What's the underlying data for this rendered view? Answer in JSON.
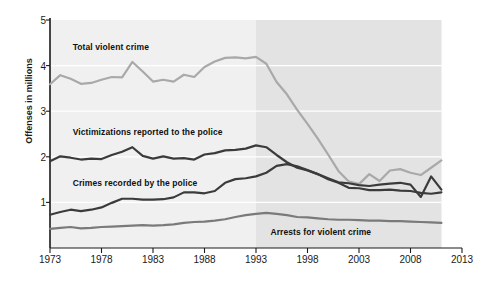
{
  "chart_data": {
    "type": "line",
    "title": "",
    "xlabel": "",
    "ylabel": "Offenses in millions",
    "xlim": [
      1973,
      2013
    ],
    "ylim": [
      0,
      5
    ],
    "xticks": [
      1973,
      1978,
      1983,
      1988,
      1993,
      1998,
      2003,
      2008,
      2013
    ],
    "yticks": [
      1,
      2,
      3,
      4,
      5
    ],
    "grid": "horizontal-white-gridlines",
    "legend": "inline-labels",
    "shaded_region": {
      "from": 1993,
      "to": 2011,
      "color": "#e3e3e3"
    },
    "plot_background": "#f0f0f0",
    "x": [
      1973,
      1974,
      1975,
      1976,
      1977,
      1978,
      1979,
      1980,
      1981,
      1982,
      1983,
      1984,
      1985,
      1986,
      1987,
      1988,
      1989,
      1990,
      1991,
      1992,
      1993,
      1994,
      1995,
      1996,
      1997,
      1998,
      1999,
      2000,
      2001,
      2002,
      2003,
      2004,
      2005,
      2006,
      2007,
      2008,
      2009,
      2010,
      2011
    ],
    "series": [
      {
        "name": "Total violent crime",
        "color": "#a9a9a9",
        "values": [
          3.59,
          3.79,
          3.71,
          3.6,
          3.62,
          3.69,
          3.75,
          3.74,
          4.08,
          3.87,
          3.65,
          3.69,
          3.65,
          3.8,
          3.75,
          3.97,
          4.09,
          4.17,
          4.18,
          4.16,
          4.19,
          4.04,
          3.64,
          3.37,
          3.03,
          2.72,
          2.4,
          2.05,
          1.69,
          1.46,
          1.4,
          1.62,
          1.47,
          1.7,
          1.73,
          1.65,
          1.6,
          1.76,
          1.92
        ]
      },
      {
        "name": "Victimizations reported to the police",
        "color": "#3b3b3b",
        "values": [
          1.9,
          2.01,
          1.98,
          1.94,
          1.96,
          1.95,
          2.04,
          2.11,
          2.21,
          2.02,
          1.96,
          2.01,
          1.96,
          1.97,
          1.94,
          2.05,
          2.08,
          2.14,
          2.15,
          2.18,
          2.25,
          2.21,
          2.04,
          1.88,
          1.76,
          1.7,
          1.62,
          1.51,
          1.43,
          1.32,
          1.31,
          1.27,
          1.27,
          1.28,
          1.26,
          1.25,
          1.21,
          1.19,
          1.22
        ]
      },
      {
        "name": "Crimes recorded by the police",
        "color": "#3b3b3b",
        "values": [
          0.73,
          0.79,
          0.84,
          0.81,
          0.84,
          0.89,
          0.99,
          1.08,
          1.08,
          1.06,
          1.06,
          1.07,
          1.11,
          1.22,
          1.22,
          1.2,
          1.25,
          1.43,
          1.51,
          1.53,
          1.57,
          1.65,
          1.8,
          1.84,
          1.79,
          1.71,
          1.62,
          1.53,
          1.44,
          1.42,
          1.38,
          1.36,
          1.39,
          1.41,
          1.43,
          1.39,
          1.12,
          1.57,
          1.28
        ]
      },
      {
        "name": "Arrests for violent crime",
        "color": "#7a7a7a",
        "values": [
          0.42,
          0.44,
          0.46,
          0.43,
          0.44,
          0.46,
          0.47,
          0.48,
          0.49,
          0.5,
          0.49,
          0.5,
          0.52,
          0.55,
          0.57,
          0.58,
          0.6,
          0.63,
          0.68,
          0.72,
          0.75,
          0.77,
          0.75,
          0.72,
          0.68,
          0.67,
          0.65,
          0.63,
          0.62,
          0.62,
          0.61,
          0.6,
          0.6,
          0.59,
          0.59,
          0.58,
          0.57,
          0.56,
          0.55
        ]
      }
    ],
    "annotations": [
      {
        "text": "Total violent crime",
        "x": 1975.2,
        "y": 4.38
      },
      {
        "text": "Victimizations reported to the police",
        "x": 1975.2,
        "y": 2.52
      },
      {
        "text": "Crimes recorded by the police",
        "x": 1975.2,
        "y": 1.4
      },
      {
        "text": "Arrests for violent crime",
        "x": 1994.4,
        "y": 0.32
      }
    ]
  },
  "axis": {
    "ylabel": "Offenses in millions",
    "ytick_labels": [
      "5",
      "4",
      "3",
      "2",
      "1"
    ],
    "xtick_labels": [
      "1973",
      "1978",
      "1983",
      "1988",
      "1993",
      "1998",
      "2003",
      "2008",
      "2013"
    ]
  },
  "labels": {
    "total_violent_crime": "Total violent crime",
    "victimizations": "Victimizations reported to the police",
    "crimes_recorded": "Crimes recorded by the police",
    "arrests": "Arrests for violent crime"
  }
}
